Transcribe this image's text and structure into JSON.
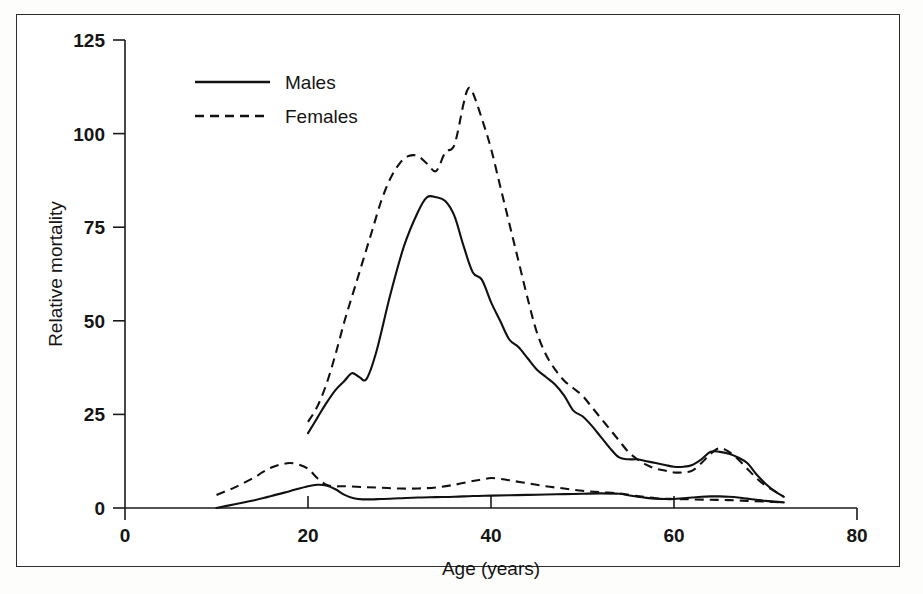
{
  "figure": {
    "background_color": "#ffffff",
    "border_color": "#2c2c2c",
    "ink_color": "#111111"
  },
  "chart_data": {
    "type": "line",
    "title": "",
    "xlabel": "Age (years)",
    "ylabel": "Relative mortality",
    "xlim": [
      0,
      80
    ],
    "ylim": [
      0,
      125
    ],
    "xticks": [
      0,
      20,
      40,
      60,
      80
    ],
    "yticks": [
      0,
      25,
      50,
      75,
      100,
      125
    ],
    "xtick_labels": [
      "0",
      "20",
      "40",
      "60",
      "80"
    ],
    "ytick_labels": [
      "0",
      "25",
      "50",
      "75",
      "100",
      "125"
    ],
    "grid": false,
    "legend_position": "upper left inside",
    "legend": [
      {
        "label": "Males",
        "style": "solid"
      },
      {
        "label": "Females",
        "style": "dashed"
      }
    ],
    "series": [
      {
        "name": "Males",
        "group": "upper",
        "style": "solid",
        "x": [
          20,
          21,
          22,
          23,
          24,
          24.8,
          25.6,
          26.4,
          27.5,
          29,
          30.5,
          32,
          33,
          34,
          35,
          36,
          37,
          38,
          39,
          40,
          41,
          42,
          43,
          44,
          45,
          46,
          47,
          48,
          49,
          50,
          51,
          52,
          53,
          54,
          55,
          56,
          57,
          58,
          59,
          60,
          61,
          62,
          63,
          64,
          65,
          66,
          67,
          68,
          69,
          70,
          71,
          72
        ],
        "y": [
          20,
          24,
          28,
          31.5,
          34,
          36,
          35,
          34.5,
          42,
          57,
          70,
          79,
          83,
          83,
          82,
          78,
          70,
          63,
          61,
          55,
          50,
          45,
          43,
          40,
          37,
          35,
          33,
          30,
          26,
          24.5,
          22,
          19,
          16,
          13.5,
          13,
          13,
          12.5,
          12,
          11.5,
          11,
          11,
          11.5,
          13,
          15,
          15,
          14.5,
          13.5,
          12,
          9,
          6.5,
          4.5,
          3
        ]
      },
      {
        "name": "Females",
        "group": "upper",
        "style": "dashed",
        "x": [
          20,
          21,
          22,
          23,
          24,
          25,
          26,
          27,
          28,
          29,
          30,
          31,
          32,
          33,
          34,
          35,
          36,
          37,
          37.5,
          38,
          39,
          40,
          41,
          42,
          43,
          44,
          45,
          46,
          47,
          48,
          49,
          50,
          51,
          52,
          53,
          54,
          55,
          56,
          57,
          58,
          59,
          60,
          61,
          62,
          63,
          64,
          65,
          66,
          67,
          68,
          69,
          70,
          71,
          72
        ],
        "y": [
          23,
          27,
          33,
          41,
          50,
          58,
          66,
          74,
          82,
          88,
          92,
          94,
          94,
          92,
          90,
          95,
          97,
          108,
          112,
          111,
          104,
          96,
          86,
          76,
          66,
          56,
          47,
          41,
          37,
          34,
          32,
          30,
          27,
          24,
          21,
          18,
          15,
          13,
          11.5,
          10.5,
          10,
          9.5,
          9.5,
          10,
          12,
          14.5,
          16,
          15,
          13,
          10.5,
          8,
          6,
          4.5,
          3
        ]
      },
      {
        "name": "Males",
        "group": "lower",
        "style": "solid",
        "x": [
          10,
          12,
          14,
          16,
          18,
          20,
          21,
          22,
          23,
          24,
          25,
          26,
          28,
          30,
          32,
          34,
          36,
          38,
          40,
          42,
          44,
          46,
          48,
          50,
          52,
          54,
          55,
          56,
          57,
          58,
          59,
          60,
          61,
          62,
          63,
          64,
          65,
          66,
          67,
          68,
          69,
          70,
          71,
          72
        ],
        "y": [
          0,
          1,
          2,
          3.2,
          4.5,
          5.8,
          6.2,
          6,
          5,
          3.5,
          2.6,
          2.3,
          2.4,
          2.6,
          2.8,
          2.9,
          3,
          3.2,
          3.3,
          3.4,
          3.5,
          3.6,
          3.7,
          3.8,
          3.9,
          3.8,
          3.4,
          3,
          2.7,
          2.5,
          2.4,
          2.4,
          2.6,
          2.8,
          3,
          3.1,
          3.1,
          3,
          2.8,
          2.5,
          2.2,
          1.9,
          1.7,
          1.5
        ]
      },
      {
        "name": "Females",
        "group": "lower",
        "style": "dashed",
        "x": [
          10,
          12,
          14,
          15,
          16,
          17,
          18,
          19,
          20,
          21,
          22,
          23,
          24,
          26,
          28,
          30,
          32,
          34,
          36,
          38,
          39,
          40,
          41,
          42,
          44,
          46,
          48,
          50,
          52,
          54,
          56,
          58,
          60,
          62,
          64,
          66,
          68,
          70,
          71,
          72
        ],
        "y": [
          3.5,
          5.5,
          8,
          9.5,
          10.8,
          11.6,
          12,
          11.6,
          10.5,
          8,
          6.2,
          5.8,
          5.8,
          5.6,
          5.4,
          5.2,
          5.2,
          5.5,
          6.2,
          7.2,
          7.6,
          8,
          7.8,
          7.4,
          6.6,
          5.8,
          5.2,
          4.6,
          4.2,
          3.9,
          3.2,
          2.6,
          2.4,
          2.3,
          2.2,
          2.1,
          1.9,
          1.7,
          1.6,
          1.5
        ]
      }
    ]
  },
  "caption": ""
}
